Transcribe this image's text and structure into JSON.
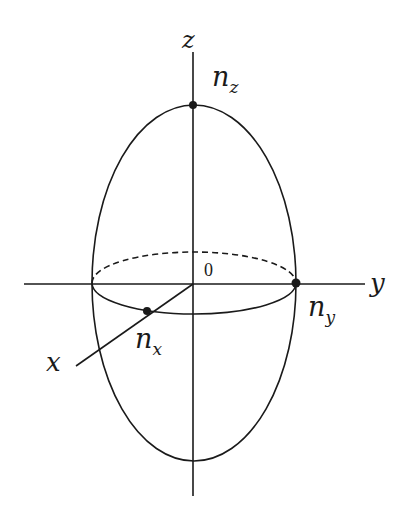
{
  "diagram": {
    "stroke_color": "#1a1a1a",
    "background": "#ffffff",
    "axes": {
      "z": {
        "label": "z"
      },
      "y": {
        "label": "y"
      },
      "x": {
        "label": "x"
      },
      "origin": {
        "label": "0"
      }
    },
    "points": {
      "nz": {
        "main": "n",
        "sub": "z"
      },
      "ny": {
        "main": "n",
        "sub": "y"
      },
      "nx": {
        "main": "n",
        "sub": "x"
      }
    }
  }
}
